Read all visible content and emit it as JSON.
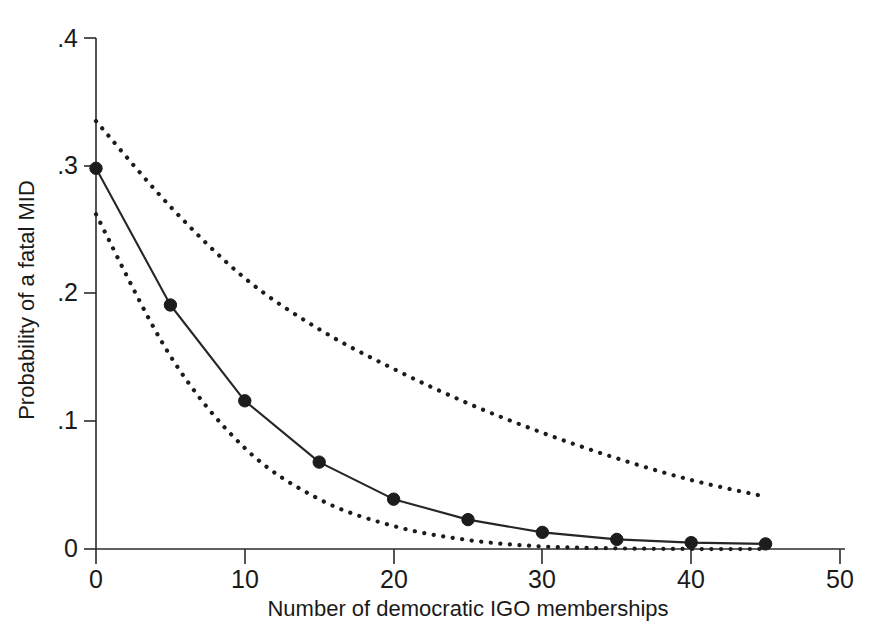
{
  "chart_data": {
    "type": "line",
    "title": "",
    "xlabel": "Number of democratic IGO memberships",
    "ylabel": "Probability of a fatal MID",
    "xlim": [
      0,
      50
    ],
    "ylim": [
      0,
      0.4
    ],
    "grid": false,
    "legend": "none",
    "xticks": [
      0,
      10,
      20,
      30,
      40,
      50
    ],
    "xticklabels": [
      "0",
      "10",
      "20",
      "30",
      "40",
      "50"
    ],
    "yticks": [
      0,
      0.1,
      0.2,
      0.3,
      0.4
    ],
    "yticklabels": [
      "0",
      ".1",
      ".2",
      ".3",
      ".4"
    ],
    "x": [
      0,
      5,
      10,
      15,
      20,
      25,
      30,
      35,
      40,
      45
    ],
    "series": [
      {
        "name": "Predicted probability",
        "style": "solid-with-markers",
        "marker": "filled-circle",
        "values": [
          0.298,
          0.191,
          0.116,
          0.068,
          0.039,
          0.023,
          0.013,
          0.0075,
          0.005,
          0.004
        ]
      },
      {
        "name": "Upper 95% confidence bound",
        "style": "dotted",
        "marker": "none",
        "x": [
          0,
          5,
          10,
          15,
          20,
          25,
          30,
          35,
          40,
          45
        ],
        "values": [
          0.335,
          0.268,
          0.212,
          0.172,
          0.141,
          0.114,
          0.091,
          0.071,
          0.054,
          0.041
        ]
      },
      {
        "name": "Lower 95% confidence bound",
        "style": "dotted",
        "marker": "none",
        "x": [
          0,
          5,
          10,
          15,
          20,
          25,
          30,
          35,
          40,
          45
        ],
        "values": [
          0.262,
          0.151,
          0.079,
          0.039,
          0.018,
          0.007,
          0.002,
          0.0005,
          0.0,
          0.0
        ]
      }
    ],
    "colors": {
      "line": "#262626",
      "marker": "#1c1c1c",
      "confidence": "#1c1c1c",
      "axis": "#2b2b2b",
      "background": "#ffffff"
    }
  },
  "figure": {
    "axis_label_x": "Number of democratic IGO memberships",
    "axis_label_y": "Probability of a fatal MID",
    "tick_labels_x": [
      "0",
      "10",
      "20",
      "30",
      "40",
      "50"
    ],
    "tick_labels_y": [
      "0",
      ".1",
      ".2",
      ".3",
      ".4"
    ]
  }
}
